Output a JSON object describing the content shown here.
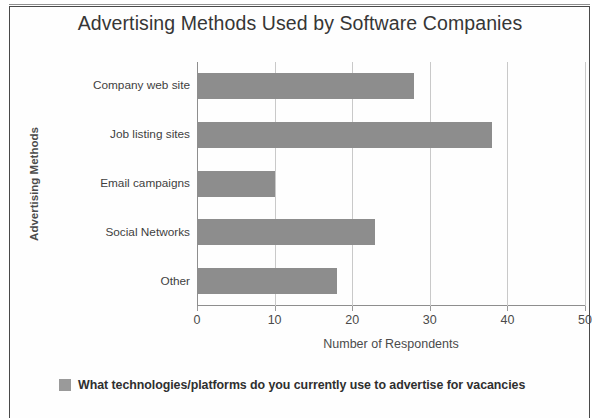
{
  "chart_data": {
    "type": "bar",
    "orientation": "horizontal",
    "title": "Advertising Methods Used by Software Companies",
    "xlabel": "Number of Respondents",
    "ylabel": "Advertising Methods",
    "categories": [
      "Company web site",
      "Job listing sites",
      "Email campaigns",
      "Social Networks",
      "Other"
    ],
    "values": [
      28,
      38,
      10,
      23,
      18
    ],
    "series": [
      {
        "name": "What technologies/platforms do you currently use to advertise for vacancies",
        "values": [
          28,
          38,
          10,
          23,
          18
        ]
      }
    ],
    "xlim": [
      0,
      50
    ],
    "xticks": [
      "0",
      "10",
      "20",
      "30",
      "40",
      "50"
    ],
    "xtick_values": [
      0,
      10,
      20,
      30,
      40,
      50
    ],
    "grid": "vertical",
    "legend_position": "bottom-left",
    "bar_color": "#8d8d8d",
    "grid_color": "#c9c9c9",
    "axis_color": "#8e8e8e",
    "text_color": "#3d3d3d"
  },
  "legend": {
    "swatch_name": "series-color-swatch",
    "label": "What technologies/platforms do you currently use to advertise for vacancies"
  }
}
